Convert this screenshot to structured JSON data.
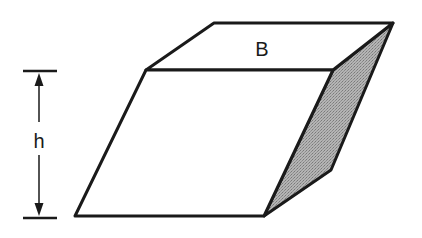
{
  "diagram": {
    "labels": {
      "base": "B",
      "height": "h"
    },
    "colors": {
      "stroke": "#1a1a1a",
      "shade": "#a8a8a8",
      "background": "#ffffff"
    }
  }
}
